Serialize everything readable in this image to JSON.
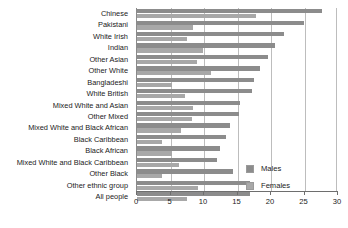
{
  "chart_data": {
    "type": "bar",
    "orientation": "horizontal",
    "title": "",
    "xlabel": "",
    "ylabel": "",
    "xlim": [
      0,
      30
    ],
    "xticks": [
      0,
      5,
      10,
      15,
      20,
      25,
      30
    ],
    "grid": true,
    "legend_position": "right-inside",
    "categories": [
      "Chinese",
      "Pakistani",
      "White Irish",
      "Indian",
      "Other Asian",
      "Other White",
      "Bangladeshi",
      "White British",
      "Mixed White and Asian",
      "Other Mixed",
      "Mixed White and Black African",
      "Black Caribbean",
      "Black African",
      "Mixed White and Black Caribbean",
      "Other Black",
      "Other ethnic group",
      "All people"
    ],
    "series": [
      {
        "name": "Males",
        "color": "#8c8c8c",
        "values": [
          27.6,
          24.9,
          21.9,
          20.6,
          19.6,
          18.4,
          17.5,
          17.2,
          15.4,
          15.2,
          13.9,
          13.3,
          12.4,
          11.9,
          14.4,
          16.9,
          16.9
        ]
      },
      {
        "name": "Females",
        "color": "#a8a8a8",
        "values": [
          17.7,
          8.4,
          7.4,
          9.9,
          8.9,
          11.0,
          5.2,
          7.2,
          8.4,
          8.2,
          6.5,
          3.7,
          5.2,
          6.2,
          3.7,
          9.1,
          7.5
        ]
      }
    ]
  },
  "legend": {
    "items": [
      {
        "label": "Males"
      },
      {
        "label": "Females"
      }
    ]
  }
}
